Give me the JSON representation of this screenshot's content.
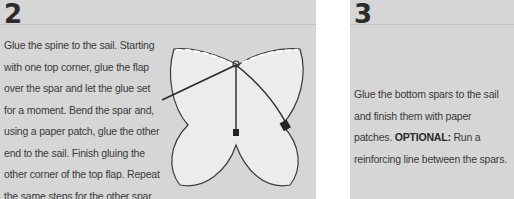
{
  "steps": [
    {
      "number": "2",
      "text": "Glue the spine to the sail. Starting with one top corner, glue the flap over the spar and let the glue set for a moment. Bend the spar and, using a paper patch, glue the other end to the sail. Finish gluing the other corner of the top flap. Repeat the same steps for the other spar.",
      "illustration": "butterfly-kite-sail-with-spine-and-spars"
    },
    {
      "number": "3",
      "text": "Glue the bottom spars to the sail and finish them with paper patches.",
      "optional_label": "OPTIONAL:",
      "optional_text": " Run a reinforcing line between the spars."
    }
  ],
  "colors": {
    "panel_bg": "#d6d6d6",
    "sail_fill": "#ececec",
    "text": "#3a3a3a",
    "number": "#2b2b2b"
  }
}
